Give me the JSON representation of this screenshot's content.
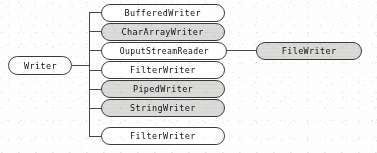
{
  "diagram": {
    "type": "class-hierarchy-tree",
    "orientation": "left-to-right",
    "root": {
      "label": "Writer",
      "shaded": false
    },
    "children": [
      {
        "label": "BufferedWriter",
        "shaded": false
      },
      {
        "label": "CharArrayWriter",
        "shaded": true
      },
      {
        "label": "OuputStreamReader",
        "shaded": false
      },
      {
        "label": "FilterWriter",
        "shaded": false
      },
      {
        "label": "PipedWriter",
        "shaded": true
      },
      {
        "label": "StringWriter",
        "shaded": true
      },
      {
        "label": "FilterWriter",
        "shaded": false
      }
    ],
    "grandchildren": [
      {
        "label": "FileWriter",
        "shaded": true,
        "parent_label": "OuputStreamReader"
      }
    ],
    "colors": {
      "node_fill_plain": "#ffffff",
      "node_fill_shaded": "#d8d8d6",
      "node_border": "#3d3d3d",
      "connector": "#4a4a4a",
      "text": "#141414",
      "background": "#fdfdfc"
    }
  }
}
